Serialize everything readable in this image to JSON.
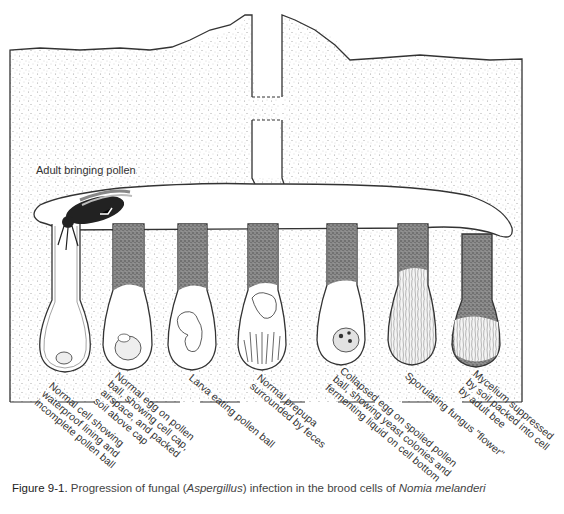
{
  "diagram": {
    "type": "cross-section illustration",
    "annotation_top": "Adult bringing pollen",
    "cells": [
      {
        "index": 1,
        "label_lines": [
          "Normal cell showing",
          "waterproof lining and",
          "incomplete pollen ball"
        ]
      },
      {
        "index": 2,
        "label_lines": [
          "Normal egg on pollen",
          "ball, showing cell cap,",
          "airspace, and packed",
          "soil above cap"
        ]
      },
      {
        "index": 3,
        "label_lines": [
          "Larva eating pollen ball"
        ]
      },
      {
        "index": 4,
        "label_lines": [
          "Normal prepupa",
          "surrounded by feces"
        ]
      },
      {
        "index": 5,
        "label_lines": [
          "Collapsed egg on spoiled pollen",
          "ball, showing yeast colonies and",
          "fermenting liquid on cell bottom"
        ]
      },
      {
        "index": 6,
        "label_lines": [
          "Sporulating fungus \"flower\""
        ]
      },
      {
        "index": 7,
        "label_lines": [
          "Mycelium suppressed",
          "by soil packed into cell",
          "by adult bee"
        ]
      }
    ],
    "colors": {
      "outline": "#333333",
      "soil_dot": "#9a9a9a",
      "packed_soil": "#6e6e6e",
      "background": "#ffffff"
    }
  },
  "caption": {
    "prefix": "Figure 9-1.",
    "text_1": " Progression of fungal (",
    "genus": "Aspergillus",
    "text_2": ") infection in the brood cells of ",
    "species": "Nomia melanderi"
  }
}
